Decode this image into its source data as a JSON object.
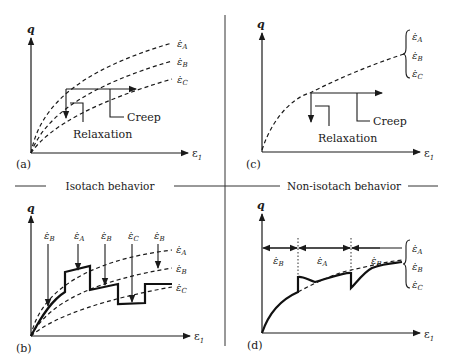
{
  "figure": {
    "section_headers": {
      "left": "Isotach behavior",
      "right": "Non-isotach behavior"
    },
    "axes": {
      "y_label": "q",
      "x_label": "ε",
      "x_label_sub": "1"
    },
    "panels": {
      "a": {
        "tag": "(a)",
        "curves": [
          "ε̇A",
          "ε̇B",
          "ε̇C"
        ],
        "annotations": {
          "creep": "Creep",
          "relaxation": "Relaxation"
        }
      },
      "c": {
        "tag": "(c)",
        "brace_labels": [
          "ε̇A",
          "ε̇B",
          "ε̇C"
        ],
        "annotations": {
          "creep": "Creep",
          "relaxation": "Relaxation"
        }
      },
      "b": {
        "tag": "(b)",
        "curves": [
          "ε̇A",
          "ε̇B",
          "ε̇C"
        ],
        "step_rates": [
          "ε̇B",
          "ε̇A",
          "ε̇B",
          "ε̇C",
          "ε̇B"
        ]
      },
      "d": {
        "tag": "(d)",
        "interval_rates": [
          "ε̇B",
          "ε̇A",
          "ε̇B"
        ],
        "brace_labels": [
          "ε̇A",
          "ε̇B",
          "ε̇C"
        ]
      }
    }
  },
  "rate_symbol": "ε̇",
  "subscripts": {
    "A": "A",
    "B": "B",
    "C": "C"
  }
}
